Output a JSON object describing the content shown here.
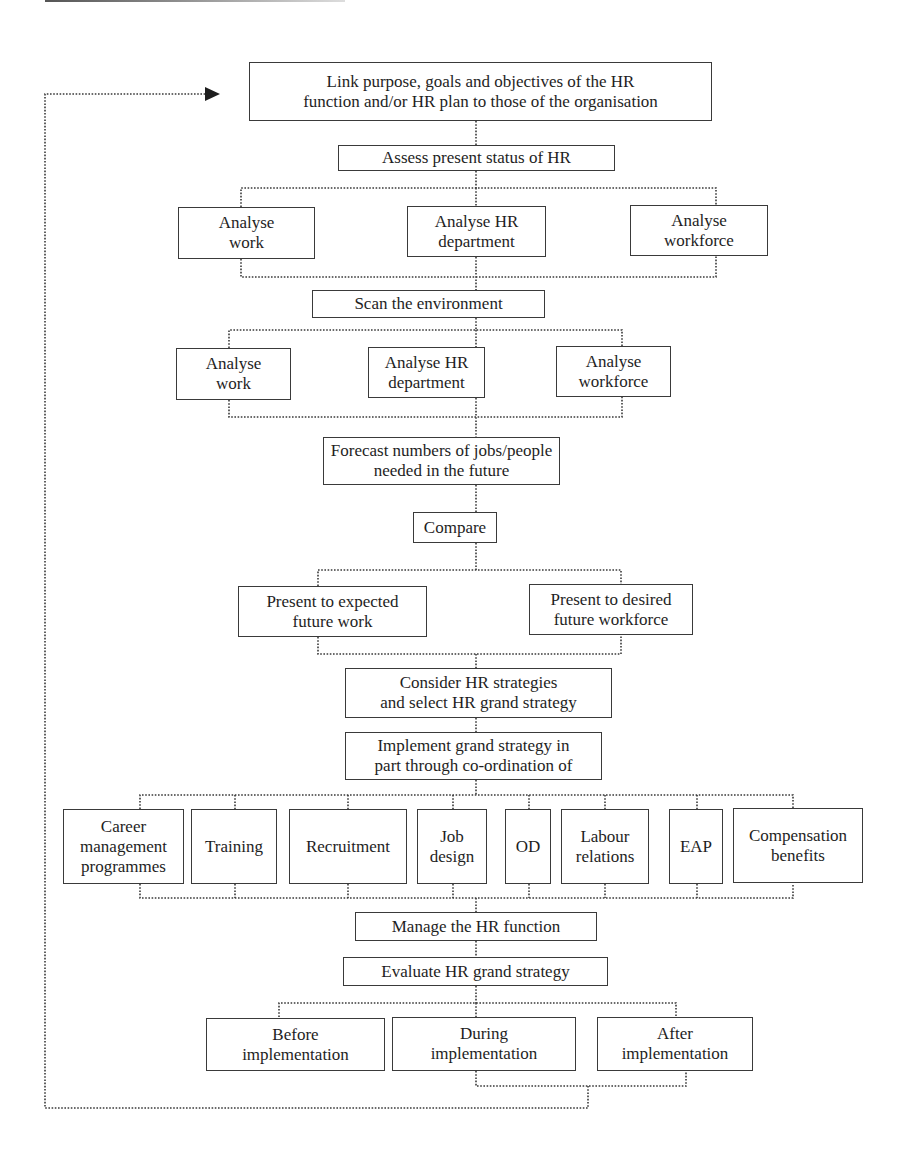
{
  "diagram": {
    "top": {
      "link": "Link purpose, goals and objectives of the HR\nfunction and/or HR plan to those of the organisation",
      "assess": "Assess present status of HR"
    },
    "assess_branches": [
      "Analyse\nwork",
      "Analyse HR\ndepartment",
      "Analyse\nworkforce"
    ],
    "scan": "Scan the environment",
    "scan_branches": [
      "Analyse\nwork",
      "Analyse HR\ndepartment",
      "Analyse\nworkforce"
    ],
    "forecast": "Forecast numbers of jobs/people\nneeded in the future",
    "compare": "Compare",
    "compare_branches": [
      "Present to expected\nfuture work",
      "Present to desired\nfuture workforce"
    ],
    "consider": "Consider HR strategies\nand select HR grand strategy",
    "implement": "Implement grand strategy in\npart through co-ordination of",
    "implement_branches": [
      "Career\nmanagement\nprogrammes",
      "Training",
      "Recruitment",
      "Job\ndesign",
      "OD",
      "Labour\nrelations",
      "EAP",
      "Compensation\nbenefits"
    ],
    "manage": "Manage the HR function",
    "evaluate": "Evaluate HR grand strategy",
    "evaluate_branches": [
      "Before\nimplementation",
      "During\nimplementation",
      "After\nimplementation"
    ],
    "feedback_arrow": "arrow-right-icon",
    "colors": {
      "line": "#3a3a3a",
      "text": "#1e1e1e",
      "background": "#ffffff"
    }
  }
}
